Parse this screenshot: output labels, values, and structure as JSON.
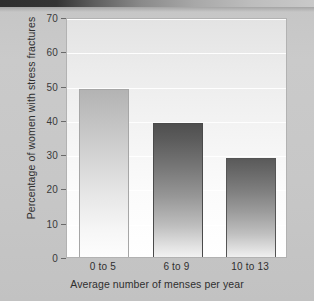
{
  "chart_data": {
    "type": "bar",
    "title": "",
    "categories": [
      "0 to 5",
      "6 to 9",
      "10 to 13"
    ],
    "values": [
      49,
      39,
      29
    ],
    "series": [
      {
        "name": "Percentage of women with stress fractures",
        "values": [
          49,
          39,
          29
        ]
      }
    ],
    "xlabel": "Average number of menses per year",
    "ylabel": "Percentage of women with stress fractures",
    "ylim": [
      0,
      70
    ],
    "ytick_labels": [
      "0",
      "10",
      "20",
      "30",
      "40",
      "50",
      "60",
      "70"
    ],
    "ytick_values": [
      0,
      10,
      20,
      30,
      40,
      50,
      60,
      70
    ],
    "grid": true,
    "legend": "none",
    "bar_colors": [
      "#c0c0c0",
      "#5c5c5c",
      "#676767"
    ],
    "plot_background": "#f4f4f4",
    "frame_color": "#b2b2b2",
    "page_background": "#c6c6c6"
  }
}
